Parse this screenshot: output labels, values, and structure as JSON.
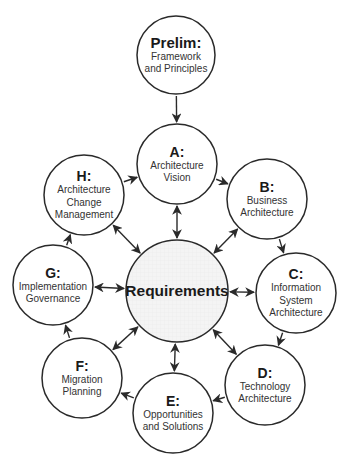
{
  "diagram": {
    "type": "TOGAF ADM cycle",
    "center": {
      "id": "req",
      "title": "Requirements",
      "cx": 177,
      "cy": 291,
      "r": 51,
      "fill": "#f3f3f3"
    },
    "nodes": [
      {
        "id": "prelim",
        "title": "Prelim:",
        "lines": [
          "Framework",
          "and Principles"
        ],
        "cx": 176,
        "cy": 55,
        "r": 39
      },
      {
        "id": "a",
        "title": "A:",
        "lines": [
          "Architecture",
          "Vision"
        ],
        "cx": 177,
        "cy": 164,
        "r": 40
      },
      {
        "id": "b",
        "title": "B:",
        "lines": [
          "Business",
          "Architecture"
        ],
        "cx": 267,
        "cy": 199,
        "r": 40
      },
      {
        "id": "c",
        "title": "C:",
        "lines": [
          "Information",
          "System",
          "Architecture"
        ],
        "cx": 296,
        "cy": 293,
        "r": 40
      },
      {
        "id": "d",
        "title": "D:",
        "lines": [
          "Technology",
          "Architecture"
        ],
        "cx": 265,
        "cy": 385,
        "r": 40
      },
      {
        "id": "e",
        "title": "E:",
        "lines": [
          "Opportunities",
          "and Solutions"
        ],
        "cx": 173,
        "cy": 413,
        "r": 40
      },
      {
        "id": "f",
        "title": "F:",
        "lines": [
          "Migration",
          "Planning"
        ],
        "cx": 82,
        "cy": 378,
        "r": 40
      },
      {
        "id": "g",
        "title": "G:",
        "lines": [
          "Implementation",
          "Governance"
        ],
        "cx": 53,
        "cy": 285,
        "r": 40
      },
      {
        "id": "h",
        "title": "H:",
        "lines": [
          "Architecture",
          "Change",
          "Management"
        ],
        "cx": 84,
        "cy": 195,
        "r": 40
      }
    ],
    "cycle_edges": [
      [
        "prelim",
        "a"
      ],
      [
        "a",
        "b"
      ],
      [
        "b",
        "c"
      ],
      [
        "c",
        "d"
      ],
      [
        "d",
        "e"
      ],
      [
        "e",
        "f"
      ],
      [
        "f",
        "g"
      ],
      [
        "g",
        "h"
      ],
      [
        "h",
        "a"
      ]
    ],
    "bidirectional_edges_to_center": [
      "a",
      "b",
      "c",
      "d",
      "e",
      "f",
      "g",
      "h"
    ],
    "colors": {
      "stroke": "#2a2a2a",
      "background": "#ffffff",
      "center_fill": "#f3f3f3",
      "text": "#222222"
    }
  }
}
